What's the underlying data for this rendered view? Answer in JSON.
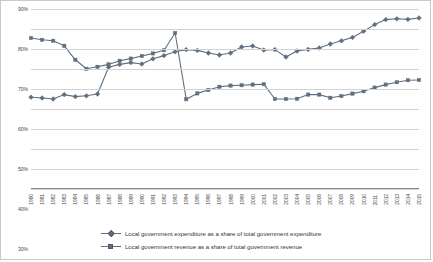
{
  "chart_data": {
    "type": "line",
    "title": "",
    "xlabel": "",
    "ylabel": "",
    "ylim": [
      0,
      90
    ],
    "grid": true,
    "legend_position": "bottom",
    "ytick_labels": [
      "90%",
      "80%",
      "70%",
      "60%",
      "50%",
      "40%",
      "30%",
      "20%",
      "10%",
      "0%"
    ],
    "ytick_values": [
      90,
      80,
      70,
      60,
      50,
      40,
      30,
      20,
      10,
      0
    ],
    "categories": [
      "1980",
      "1981",
      "1982",
      "1983",
      "1984",
      "1985",
      "1986",
      "1987",
      "1988",
      "1989",
      "1990",
      "1991",
      "1992",
      "1993",
      "1994",
      "1995",
      "1996",
      "1997",
      "1998",
      "1999",
      "2000",
      "2001",
      "2002",
      "2003",
      "2004",
      "2005",
      "2006",
      "2007",
      "2008",
      "2009",
      "2010",
      "2011",
      "2012",
      "2013",
      "2014",
      "2015"
    ],
    "series": [
      {
        "name": "Local government expenditure as a share of total government expenditure",
        "color": "#5f6f7f",
        "marker": "diamond",
        "values": [
          45.9,
          45.5,
          45.0,
          47.2,
          46.2,
          46.6,
          47.5,
          60.9,
          62.3,
          63.2,
          62.5,
          65.1,
          66.7,
          68.6,
          69.7,
          69.3,
          68.0,
          67.0,
          68.0,
          71.0,
          71.5,
          69.5,
          69.7,
          66.0,
          69.0,
          69.8,
          70.5,
          72.5,
          74.1,
          75.8,
          78.9,
          82.2,
          84.7,
          85.1,
          84.8,
          85.5
        ]
      },
      {
        "name": "Local government revenue as a share of total government revenue",
        "color": "#5f6f7f",
        "marker": "square",
        "values": [
          75.5,
          74.6,
          74.1,
          71.6,
          64.6,
          60.1,
          61.1,
          62.3,
          64.1,
          65.2,
          66.5,
          67.8,
          69.4,
          78.0,
          44.9,
          47.8,
          49.5,
          51.1,
          51.7,
          51.9,
          52.2,
          52.4,
          45.0,
          45.0,
          45.1,
          47.2,
          47.2,
          45.6,
          46.5,
          47.7,
          48.9,
          50.7,
          52.2,
          53.4,
          54.4,
          54.5
        ]
      }
    ]
  },
  "legend": {
    "items": [
      {
        "label": "Local government expenditure as a share of total government expenditure"
      },
      {
        "label": "Local government revenue as a share of total government revenue"
      }
    ]
  }
}
